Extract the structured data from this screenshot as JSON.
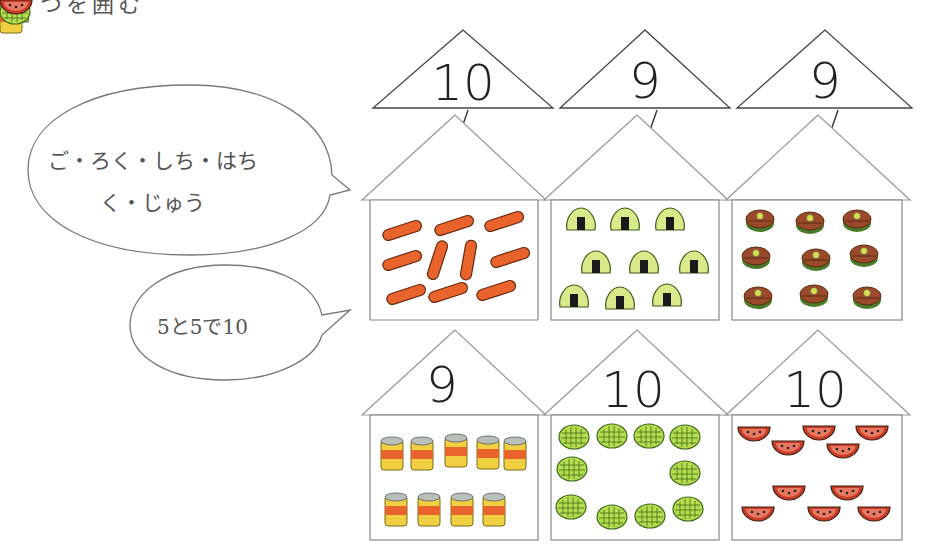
{
  "header": {
    "clipped_text": "つを囲む"
  },
  "bubbles": [
    {
      "line1": "ご・ろく・しち・はち",
      "line2": "く・じゅう"
    },
    {
      "text": "5と5で10"
    }
  ],
  "top_row": {
    "labels": [
      "10",
      "9",
      "9"
    ],
    "houses": [
      {
        "item": "sausage",
        "count": 10
      },
      {
        "item": "onigiri",
        "count": 9
      },
      {
        "item": "dorayaki",
        "count": 9
      }
    ]
  },
  "bottom_row": {
    "houses": [
      {
        "label": "9",
        "item": "can",
        "count": 9
      },
      {
        "label": "10",
        "item": "melon-bun",
        "count": 10
      },
      {
        "label": "10",
        "item": "watermelon-slice",
        "count": 10
      }
    ]
  },
  "colors": {
    "sausage": "#e8642c",
    "onigiri_rice": "#d8ea8a",
    "nori": "#1a1a1a",
    "dorayaki": "#9a4a2a",
    "can_body": "#f0d040",
    "can_stripe": "#e8642c",
    "melon_bun": "#b8dc50",
    "watermelon": "#c83c28"
  }
}
